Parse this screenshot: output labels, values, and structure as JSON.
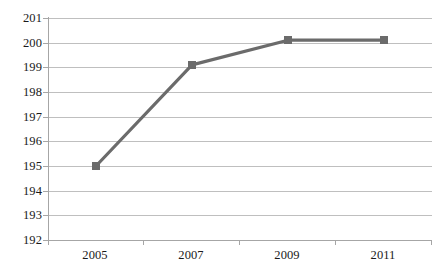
{
  "chart_data": {
    "type": "line",
    "title": "",
    "xlabel": "",
    "ylabel": "",
    "categories": [
      "2005",
      "2007",
      "2009",
      "2011"
    ],
    "series": [
      {
        "name": "Series 1",
        "values": [
          195,
          199.1,
          200.1,
          200.1
        ],
        "color": "#6b6b6b",
        "marker": "square"
      }
    ],
    "ylim": [
      192,
      201
    ],
    "yticks": [
      192,
      193,
      194,
      195,
      196,
      197,
      198,
      199,
      200,
      201
    ],
    "ytick_labels": [
      "192",
      "193",
      "194",
      "195",
      "196",
      "197",
      "198",
      "199",
      "200",
      "201"
    ],
    "grid": true,
    "grid_color": "#bfbfbf",
    "axis_color": "#a6a6a6",
    "legend": false,
    "legend_position": "none",
    "background": "#ffffff"
  }
}
